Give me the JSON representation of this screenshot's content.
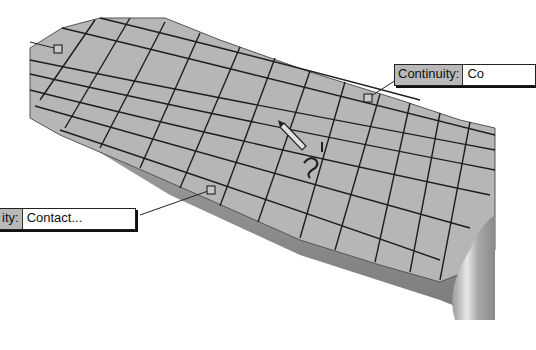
{
  "viewport": {
    "background": "#ffffff",
    "surface_color": "#b4b4b4",
    "grid_color": "#1e1e1e"
  },
  "callouts": [
    {
      "id": "top-right",
      "label": "Continuity:",
      "value": "Co"
    },
    {
      "id": "left",
      "label": "ity:",
      "value": "Contact..."
    }
  ],
  "cursor": {
    "icon": "pencil-tangent-cursor-icon"
  },
  "handles": [
    {
      "id": "handle-top-left"
    },
    {
      "id": "handle-top-right"
    },
    {
      "id": "handle-left-middle"
    }
  ]
}
